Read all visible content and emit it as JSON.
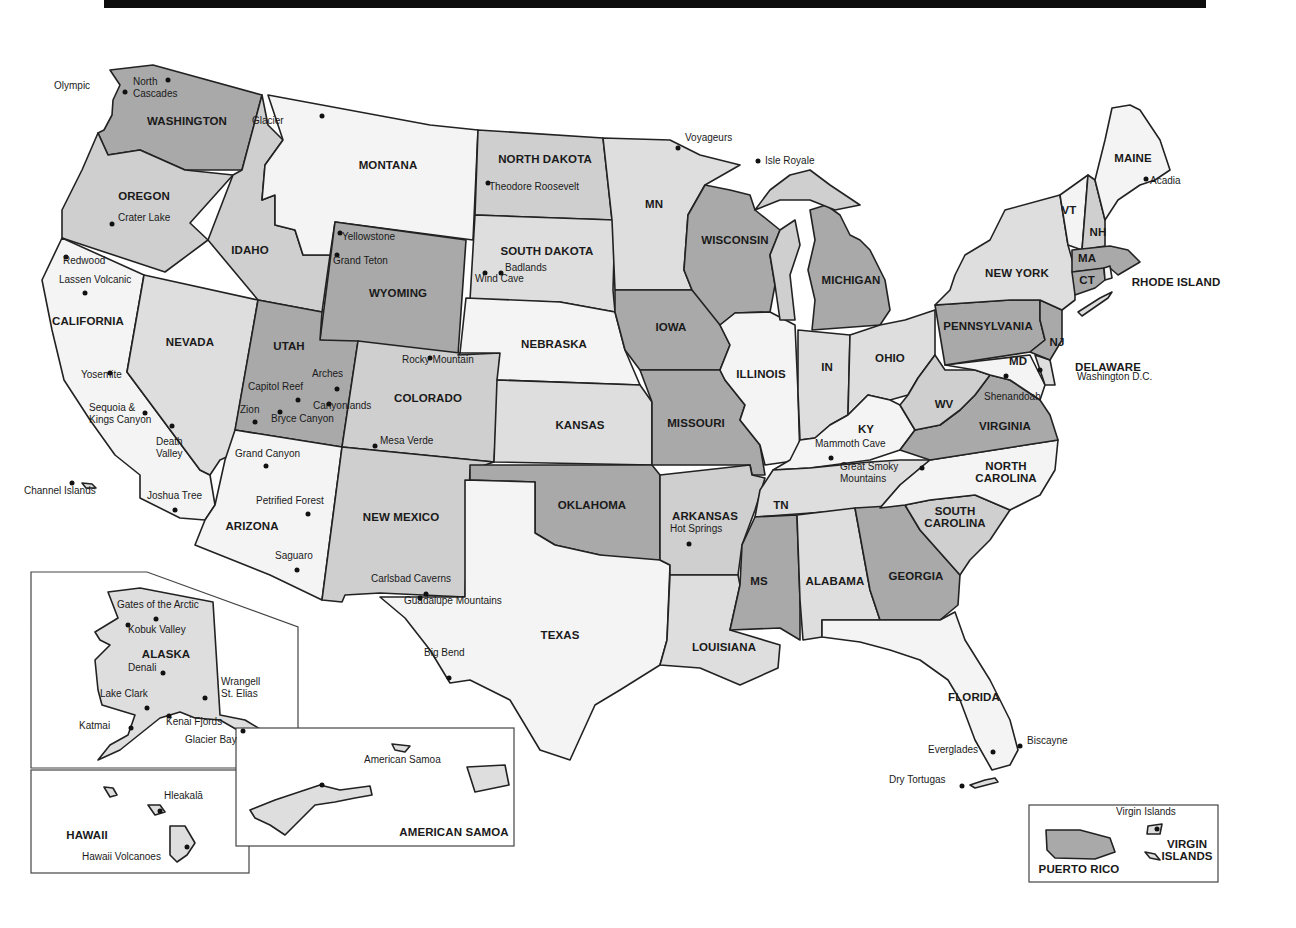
{
  "map": {
    "title": "National Parks of the United States",
    "fill_colors": {
      "white": "#f4f4f4",
      "light": "#dedede",
      "medium": "#cfcfcf",
      "dark": "#a9a9a9"
    },
    "states": [
      {
        "id": "wa",
        "label": "WASHINGTON",
        "x": 187,
        "y": 121
      },
      {
        "id": "or",
        "label": "OREGON",
        "x": 144,
        "y": 196
      },
      {
        "id": "ca",
        "label": "CALIFORNIA",
        "x": 88,
        "y": 321
      },
      {
        "id": "id",
        "label": "IDAHO",
        "x": 250,
        "y": 250
      },
      {
        "id": "nv",
        "label": "NEVADA",
        "x": 190,
        "y": 342
      },
      {
        "id": "mt",
        "label": "MONTANA",
        "x": 388,
        "y": 165
      },
      {
        "id": "wy",
        "label": "WYOMING",
        "x": 398,
        "y": 293
      },
      {
        "id": "ut",
        "label": "UTAH",
        "x": 289,
        "y": 346
      },
      {
        "id": "co",
        "label": "COLORADO",
        "x": 428,
        "y": 398
      },
      {
        "id": "az",
        "label": "ARIZONA",
        "x": 252,
        "y": 526
      },
      {
        "id": "nm",
        "label": "NEW MEXICO",
        "x": 401,
        "y": 517
      },
      {
        "id": "nd",
        "label": "NORTH DAKOTA",
        "x": 545,
        "y": 159
      },
      {
        "id": "sd",
        "label": "SOUTH DAKOTA",
        "x": 547,
        "y": 251
      },
      {
        "id": "ne",
        "label": "NEBRASKA",
        "x": 554,
        "y": 344
      },
      {
        "id": "ks",
        "label": "KANSAS",
        "x": 580,
        "y": 425
      },
      {
        "id": "ok",
        "label": "OKLAHOMA",
        "x": 592,
        "y": 505
      },
      {
        "id": "tx",
        "label": "TEXAS",
        "x": 560,
        "y": 635
      },
      {
        "id": "mn",
        "label": "MN",
        "x": 654,
        "y": 204
      },
      {
        "id": "ia",
        "label": "IOWA",
        "x": 671,
        "y": 327
      },
      {
        "id": "mo",
        "label": "MISSOURI",
        "x": 696,
        "y": 423
      },
      {
        "id": "ar",
        "label": "ARKANSAS",
        "x": 705,
        "y": 516
      },
      {
        "id": "la",
        "label": "LOUISIANA",
        "x": 724,
        "y": 647
      },
      {
        "id": "wi",
        "label": "WISCONSIN",
        "x": 735,
        "y": 240
      },
      {
        "id": "il",
        "label": "ILLINOIS",
        "x": 761,
        "y": 374
      },
      {
        "id": "mi",
        "label": "MICHIGAN",
        "x": 851,
        "y": 280
      },
      {
        "id": "in",
        "label": "IN",
        "x": 827,
        "y": 367
      },
      {
        "id": "oh",
        "label": "OHIO",
        "x": 890,
        "y": 358
      },
      {
        "id": "ky",
        "label": "KY",
        "x": 866,
        "y": 429
      },
      {
        "id": "tn",
        "label": "TN",
        "x": 781,
        "y": 505
      },
      {
        "id": "ms",
        "label": "MS",
        "x": 759,
        "y": 581
      },
      {
        "id": "al",
        "label": "ALABAMA",
        "x": 835,
        "y": 581
      },
      {
        "id": "ga",
        "label": "GEORGIA",
        "x": 916,
        "y": 576
      },
      {
        "id": "fl",
        "label": "FLORIDA",
        "x": 974,
        "y": 697
      },
      {
        "id": "sc",
        "label": "SOUTH\nCAROLINA",
        "x": 955,
        "y": 517
      },
      {
        "id": "nc",
        "label": "NORTH\nCAROLINA",
        "x": 1006,
        "y": 472
      },
      {
        "id": "va",
        "label": "VIRGINIA",
        "x": 1005,
        "y": 426
      },
      {
        "id": "wv",
        "label": "WV",
        "x": 944,
        "y": 404
      },
      {
        "id": "md",
        "label": "MD",
        "x": 1018,
        "y": 361
      },
      {
        "id": "pa",
        "label": "PENNSYLVANIA",
        "x": 988,
        "y": 326
      },
      {
        "id": "ny",
        "label": "NEW YORK",
        "x": 1017,
        "y": 273
      },
      {
        "id": "nj",
        "label": "NJ",
        "x": 1057,
        "y": 342
      },
      {
        "id": "de",
        "label": "DELAWARE",
        "x": 1108,
        "y": 367
      },
      {
        "id": "ct",
        "label": "CT",
        "x": 1087,
        "y": 280
      },
      {
        "id": "ri",
        "label": "RHODE ISLAND",
        "x": 1176,
        "y": 282
      },
      {
        "id": "ma",
        "label": "MA",
        "x": 1087,
        "y": 258
      },
      {
        "id": "vt",
        "label": "VT",
        "x": 1069,
        "y": 210
      },
      {
        "id": "nh",
        "label": "NH",
        "x": 1098,
        "y": 232
      },
      {
        "id": "me",
        "label": "MAINE",
        "x": 1133,
        "y": 158
      },
      {
        "id": "ak",
        "label": "ALASKA",
        "x": 166,
        "y": 654
      },
      {
        "id": "hi",
        "label": "HAWAII",
        "x": 87,
        "y": 835
      },
      {
        "id": "as",
        "label": "AMERICAN SAMOA",
        "x": 454,
        "y": 832
      },
      {
        "id": "pr",
        "label": "PUERTO RICO",
        "x": 1079,
        "y": 869
      },
      {
        "id": "vi",
        "label": "VIRGIN\nISLANDS",
        "x": 1187,
        "y": 850
      }
    ],
    "parks": [
      {
        "name": "Olympic",
        "lx": 54,
        "ly": 86,
        "dx": 125,
        "dy": 92
      },
      {
        "name": "North\nCascades",
        "lx": 133,
        "ly": 82,
        "dx": 168,
        "dy": 80
      },
      {
        "name": "Glacier",
        "lx": 252,
        "ly": 121,
        "dx": 322,
        "dy": 116
      },
      {
        "name": "Theodore Roosevelt",
        "lx": 489,
        "ly": 187,
        "dx": 488,
        "dy": 183
      },
      {
        "name": "Voyageurs",
        "lx": 685,
        "ly": 138,
        "dx": 678,
        "dy": 148
      },
      {
        "name": "Isle Royale",
        "lx": 765,
        "ly": 161,
        "dx": 758,
        "dy": 161
      },
      {
        "name": "Acadia",
        "lx": 1150,
        "ly": 181,
        "dx": 1146,
        "dy": 179
      },
      {
        "name": "Crater Lake",
        "lx": 118,
        "ly": 218,
        "dx": 112,
        "dy": 224
      },
      {
        "name": "Yellowstone",
        "lx": 342,
        "ly": 237,
        "dx": 340,
        "dy": 233
      },
      {
        "name": "Grand Teton",
        "lx": 333,
        "ly": 261,
        "dx": 337,
        "dy": 255
      },
      {
        "name": "Badlands",
        "lx": 505,
        "ly": 268,
        "dx": 501,
        "dy": 273
      },
      {
        "name": "Wind Cave",
        "lx": 475,
        "ly": 279,
        "dx": 485,
        "dy": 273
      },
      {
        "name": "Redwood",
        "lx": 63,
        "ly": 261,
        "dx": 66,
        "dy": 257
      },
      {
        "name": "Lassen Volcanic",
        "lx": 59,
        "ly": 280,
        "dx": 85,
        "dy": 293
      },
      {
        "name": "Yosemite",
        "lx": 81,
        "ly": 375,
        "dx": 110,
        "dy": 373
      },
      {
        "name": "Sequoia &\nKings Canyon",
        "lx": 89,
        "ly": 408,
        "dx": 145,
        "dy": 413
      },
      {
        "name": "Death\nValley",
        "lx": 156,
        "ly": 442,
        "dx": 172,
        "dy": 426
      },
      {
        "name": "Channel Islands",
        "lx": 24,
        "ly": 491,
        "dx": 72,
        "dy": 483
      },
      {
        "name": "Joshua Tree",
        "lx": 147,
        "ly": 496,
        "dx": 175,
        "dy": 510
      },
      {
        "name": "Arches",
        "lx": 312,
        "ly": 374,
        "dx": 337,
        "dy": 389
      },
      {
        "name": "Capitol Reef",
        "lx": 248,
        "ly": 387,
        "dx": 298,
        "dy": 400
      },
      {
        "name": "Canyonlands",
        "lx": 313,
        "ly": 406,
        "dx": 329,
        "dy": 404
      },
      {
        "name": "Zion",
        "lx": 240,
        "ly": 410,
        "dx": 255,
        "dy": 422
      },
      {
        "name": "Bryce Canyon",
        "lx": 271,
        "ly": 419,
        "dx": 280,
        "dy": 412
      },
      {
        "name": "Rocky Mountain",
        "lx": 402,
        "ly": 360,
        "dx": 430,
        "dy": 358
      },
      {
        "name": "Mesa Verde",
        "lx": 380,
        "ly": 441,
        "dx": 375,
        "dy": 446
      },
      {
        "name": "Grand Canyon",
        "lx": 235,
        "ly": 454,
        "dx": 266,
        "dy": 466
      },
      {
        "name": "Petrified Forest",
        "lx": 256,
        "ly": 501,
        "dx": 308,
        "dy": 514
      },
      {
        "name": "Saguaro",
        "lx": 275,
        "ly": 556,
        "dx": 297,
        "dy": 570
      },
      {
        "name": "Carlsbad Caverns",
        "lx": 371,
        "ly": 579,
        "dx": 426,
        "dy": 594
      },
      {
        "name": "Guadalupe Mountains",
        "lx": 404,
        "ly": 601,
        "dx": 420,
        "dy": 598
      },
      {
        "name": "Big Bend",
        "lx": 424,
        "ly": 653,
        "dx": 449,
        "dy": 678
      },
      {
        "name": "Hot Springs",
        "lx": 670,
        "ly": 529,
        "dx": 689,
        "dy": 544
      },
      {
        "name": "Mammoth Cave",
        "lx": 815,
        "ly": 444,
        "dx": 831,
        "dy": 458
      },
      {
        "name": "Great Smoky\nMountains",
        "lx": 840,
        "ly": 467,
        "dx": 922,
        "dy": 468
      },
      {
        "name": "Shenandoah",
        "lx": 984,
        "ly": 397,
        "dx": 1006,
        "dy": 376
      },
      {
        "name": "Washington D.C.",
        "lx": 1077,
        "ly": 377,
        "dx": 1040,
        "dy": 370
      },
      {
        "name": "Everglades",
        "lx": 928,
        "ly": 750,
        "dx": 993,
        "dy": 752
      },
      {
        "name": "Biscayne",
        "lx": 1027,
        "ly": 741,
        "dx": 1020,
        "dy": 746
      },
      {
        "name": "Dry Tortugas",
        "lx": 889,
        "ly": 780,
        "dx": 962,
        "dy": 786
      },
      {
        "name": "Gates of the Arctic",
        "lx": 117,
        "ly": 605,
        "dx": 156,
        "dy": 619
      },
      {
        "name": "Kobuk Valley",
        "lx": 128,
        "ly": 630,
        "dx": 128,
        "dy": 625
      },
      {
        "name": "Denali",
        "lx": 128,
        "ly": 668,
        "dx": 163,
        "dy": 673
      },
      {
        "name": "Lake Clark",
        "lx": 100,
        "ly": 694,
        "dx": 147,
        "dy": 708
      },
      {
        "name": "Wrangell\nSt. Elias",
        "lx": 221,
        "ly": 682,
        "dx": 205,
        "dy": 698
      },
      {
        "name": "Katmai",
        "lx": 79,
        "ly": 726,
        "dx": 131,
        "dy": 728
      },
      {
        "name": "Kenai Fjords",
        "lx": 166,
        "ly": 722,
        "dx": 169,
        "dy": 716
      },
      {
        "name": "Glacier Bay",
        "lx": 185,
        "ly": 740,
        "dx": 243,
        "dy": 731
      },
      {
        "name": "Hleakalā",
        "lx": 164,
        "ly": 796,
        "dx": 160,
        "dy": 811
      },
      {
        "name": "Hawaii Volcanoes",
        "lx": 82,
        "ly": 857,
        "dx": 187,
        "dy": 847
      },
      {
        "name": "American Samoa",
        "lx": 364,
        "ly": 760,
        "dx": 322,
        "dy": 785
      },
      {
        "name": "Virgin Islands",
        "lx": 1116,
        "ly": 812,
        "dx": 1157,
        "dy": 829
      }
    ]
  }
}
